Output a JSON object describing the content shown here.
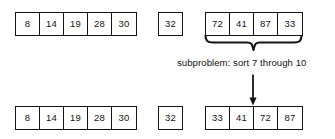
{
  "diagram": {
    "caption": "subproblem: sort 7 through 10",
    "stroke_color": "#141414",
    "background_color": "#ffffff",
    "rows": [
      {
        "name": "before",
        "groups": [
          {
            "name": "left-segment",
            "values": [
              "8",
              "14",
              "19",
              "28",
              "30"
            ]
          },
          {
            "name": "pivot-segment",
            "values": [
              "32"
            ]
          },
          {
            "name": "unsorted-segment",
            "values": [
              "72",
              "41",
              "87",
              "33"
            ]
          }
        ]
      },
      {
        "name": "after",
        "groups": [
          {
            "name": "left-segment",
            "values": [
              "8",
              "14",
              "19",
              "28",
              "30"
            ]
          },
          {
            "name": "pivot-segment",
            "values": [
              "32"
            ]
          },
          {
            "name": "sorted-segment",
            "values": [
              "33",
              "41",
              "72",
              "87"
            ]
          }
        ]
      }
    ],
    "annotations": {
      "brace": "curly-brace-down",
      "arrow": "arrow-down"
    }
  }
}
